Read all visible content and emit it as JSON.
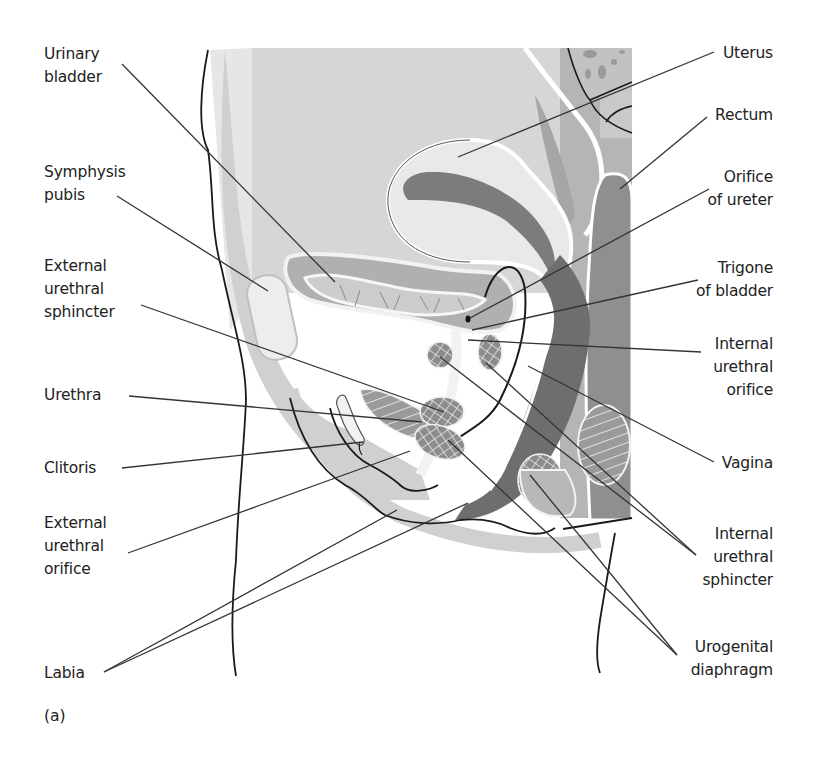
{
  "figure": {
    "panel_letter": "(a)",
    "colors": {
      "background": "#ffffff",
      "light_gray": "#d9d9d9",
      "mid_gray": "#b3b3b3",
      "dark_gray": "#7a7a7a",
      "darker_gray": "#5e5e5e",
      "outline": "#1a1a1a",
      "leader": "#333333",
      "tissue_white": "#f4f4f4"
    },
    "labels_left": [
      {
        "id": "urinary-bladder",
        "text": "Urinary\nbladder",
        "x": 44,
        "y": 47
      },
      {
        "id": "symphysis-pubis",
        "text": "Symphysis\npubis",
        "x": 44,
        "y": 163
      },
      {
        "id": "external-urethral-sphincter",
        "text": "External\nurethral\nsphincter",
        "x": 44,
        "y": 257
      },
      {
        "id": "urethra",
        "text": "Urethra",
        "x": 44,
        "y": 382
      },
      {
        "id": "clitoris",
        "text": "Clitoris",
        "x": 44,
        "y": 454
      },
      {
        "id": "external-urethral-orifice",
        "text": "External\nurethral\norifice",
        "x": 44,
        "y": 511
      },
      {
        "id": "labia",
        "text": "Labia",
        "x": 44,
        "y": 664
      }
    ],
    "labels_right": [
      {
        "id": "uterus",
        "text": "Uterus",
        "right": 773,
        "y": 42
      },
      {
        "id": "rectum",
        "text": "Rectum",
        "right": 773,
        "y": 104
      },
      {
        "id": "orifice-of-ureter",
        "text": "Orifice\nof ureter",
        "right": 773,
        "y": 166
      },
      {
        "id": "trigone-of-bladder",
        "text": "Trigone\nof bladder",
        "right": 773,
        "y": 257
      },
      {
        "id": "internal-urethral-orifice",
        "text": "Internal\nurethral\norifice",
        "right": 773,
        "y": 333
      },
      {
        "id": "vagina",
        "text": "Vagina",
        "right": 773,
        "y": 452
      },
      {
        "id": "internal-urethral-sphincter",
        "text": "Internal\nurethral\nsphincter",
        "right": 773,
        "y": 523
      },
      {
        "id": "urogenital-diaphragm",
        "text": "Urogenital\ndiaphragm",
        "right": 773,
        "y": 636
      }
    ]
  }
}
